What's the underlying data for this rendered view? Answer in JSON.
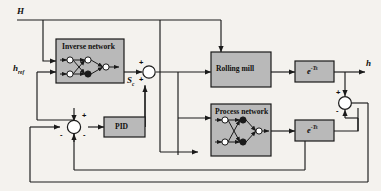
{
  "diagram": {
    "background_color": "#f4f2ee",
    "block_fill": "#b9b9b9",
    "line_color": "#1a1a1a"
  },
  "signals": {
    "input_disturbance": "H",
    "input_reference": "h",
    "input_reference_sub": "ref",
    "control_signal": "S",
    "control_signal_sub": "c",
    "output": "h"
  },
  "blocks": [
    {
      "id": "inverse-network",
      "label": "Inverse network"
    },
    {
      "id": "rolling-mill",
      "label": "Rolling mill"
    },
    {
      "id": "pid",
      "label": "PID"
    },
    {
      "id": "process-network",
      "label": "Process network"
    },
    {
      "id": "delay-top",
      "label": "e",
      "exponent": "-Ts"
    },
    {
      "id": "delay-bottom",
      "label": "e",
      "exponent": "-Ts"
    }
  ],
  "summing_junctions": [
    {
      "id": "sum-control",
      "signs": [
        {
          "symbol": "+",
          "position": "top-left"
        },
        {
          "symbol": "+",
          "position": "bottom-left"
        }
      ]
    },
    {
      "id": "sum-error",
      "signs": [
        {
          "symbol": "+",
          "position": "top-right"
        },
        {
          "symbol": "-",
          "position": "left"
        },
        {
          "symbol": "-",
          "position": "bottom-right"
        }
      ]
    },
    {
      "id": "sum-model-error",
      "signs": [
        {
          "symbol": "+",
          "position": "top-left"
        },
        {
          "symbol": "-",
          "position": "bottom-left"
        }
      ]
    }
  ]
}
